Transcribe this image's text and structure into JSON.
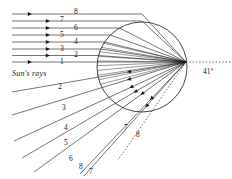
{
  "figure": {
    "caption_text": "Sun's rays",
    "angle_label": "41°",
    "stroke_color": "#1a1a1a",
    "background_color": "#ffffff",
    "drop": {
      "cx": 142,
      "cy": 67,
      "r": 45
    },
    "focus": {
      "x": 186,
      "y": 62
    }
  },
  "incoming_labels": [
    {
      "id": "in-8",
      "text": "8",
      "x": 74,
      "y": 8
    },
    {
      "id": "in-7",
      "text": "7",
      "x": 60,
      "y": 16
    },
    {
      "id": "in-6",
      "text": "6",
      "x": 74,
      "y": 24
    },
    {
      "id": "in-5",
      "text": "5",
      "x": 60,
      "y": 31
    },
    {
      "id": "in-4",
      "text": "4",
      "x": 74,
      "y": 38
    },
    {
      "id": "in-3",
      "text": "3",
      "x": 60,
      "y": 45
    },
    {
      "id": "in-2",
      "text": "2",
      "x": 74,
      "y": 51
    },
    {
      "id": "in-1",
      "text": "1",
      "x": 60,
      "y": 58
    }
  ],
  "outgoing_labels": [
    {
      "id": "out-2",
      "text": "2",
      "x": 58,
      "y": 83
    },
    {
      "id": "out-3",
      "text": "3",
      "x": 62,
      "y": 104
    },
    {
      "id": "out-4",
      "text": "4",
      "x": 64,
      "y": 124
    },
    {
      "id": "out-5",
      "text": "5",
      "x": 64,
      "y": 139
    },
    {
      "id": "out-6",
      "text": "6",
      "x": 69,
      "y": 155
    },
    {
      "id": "out-8-low",
      "text": "8",
      "x": 79,
      "y": 163
    },
    {
      "id": "out-7-low",
      "text": "7",
      "x": 89,
      "y": 168
    },
    {
      "id": "out-7-mid",
      "text": "7",
      "x": 124,
      "y": 124
    },
    {
      "id": "out-8-mid",
      "text": "8",
      "x": 136,
      "y": 131
    }
  ],
  "incoming_rays": [
    {
      "id": "ray-in-1",
      "y": 62,
      "x1": 12,
      "x2": 186,
      "arrow_x": 32
    },
    {
      "id": "ray-in-2",
      "y": 55.5,
      "x1": 12,
      "x2": 186,
      "arrow_x": 50
    },
    {
      "id": "ray-in-3",
      "y": 49,
      "x1": 12,
      "x2": 186,
      "arrow_x": 50
    },
    {
      "id": "ray-in-4",
      "y": 42,
      "x1": 12,
      "x2": 186,
      "arrow_x": 50
    },
    {
      "id": "ray-in-5",
      "y": 35,
      "x1": 12,
      "x2": 186,
      "arrow_x": 50
    },
    {
      "id": "ray-in-6",
      "y": 28,
      "x1": 12,
      "x2": 186,
      "arrow_x": 50
    },
    {
      "id": "ray-in-7",
      "y": 21,
      "x1": 12,
      "x2": 186,
      "arrow_x": 50
    },
    {
      "id": "ray-in-8",
      "y": 14,
      "x1": 12,
      "x2": 186,
      "arrow_x": 32
    }
  ],
  "outgoing_rays": [
    {
      "id": "ray-out-2",
      "x1": 12,
      "y1": 92,
      "x2": 186,
      "y2": 62,
      "arrow_t": 0.34
    },
    {
      "id": "ray-out-3",
      "x1": 12,
      "y1": 115,
      "x2": 186,
      "y2": 62,
      "arrow_t": 0.34
    },
    {
      "id": "ray-out-4",
      "x1": 14,
      "y1": 141,
      "x2": 186,
      "y2": 62,
      "arrow_t": 0.33
    },
    {
      "id": "ray-out-5",
      "x1": 22,
      "y1": 158,
      "x2": 186,
      "y2": 62,
      "arrow_t": 0.32
    },
    {
      "id": "ray-out-6",
      "x1": 34,
      "y1": 172,
      "x2": 186,
      "y2": 62,
      "arrow_t": 0.3
    },
    {
      "id": "ray-out-7",
      "x1": 80,
      "y1": 174,
      "x2": 186,
      "y2": 62,
      "arrow_t": 0.34
    },
    {
      "id": "ray-out-8",
      "x1": 84,
      "y1": 176,
      "x2": 186,
      "y2": 62,
      "arrow_t": 0.4
    }
  ],
  "dotted_lines": [
    {
      "id": "dotted-axis",
      "x1": 186,
      "y1": 62,
      "x2": 231,
      "y2": 62
    },
    {
      "id": "dotted-angle",
      "x1": 186,
      "y1": 62,
      "x2": 118,
      "y2": 160
    }
  ]
}
